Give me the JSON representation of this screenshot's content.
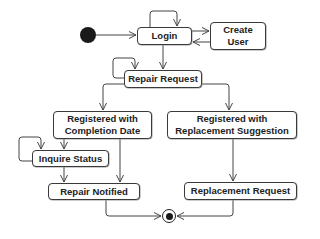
{
  "diagram": {
    "type": "UML activity diagram",
    "initial_node": {
      "id": "start"
    },
    "final_node": {
      "id": "end"
    },
    "nodes": [
      {
        "id": "login",
        "lines": [
          "Login"
        ]
      },
      {
        "id": "create_user",
        "lines": [
          "Create",
          "User"
        ]
      },
      {
        "id": "repair_request",
        "lines": [
          "Repair Request"
        ]
      },
      {
        "id": "reg_completion",
        "lines": [
          "Registered with",
          "Completion Date"
        ]
      },
      {
        "id": "reg_replacement",
        "lines": [
          "Registered with",
          "Replacement Suggestion"
        ]
      },
      {
        "id": "inquire_status",
        "lines": [
          "Inquire Status"
        ]
      },
      {
        "id": "repair_notified",
        "lines": [
          "Repair Notified"
        ]
      },
      {
        "id": "replacement_request",
        "lines": [
          "Replacement Request"
        ]
      }
    ],
    "edges": [
      {
        "from": "start",
        "to": "login"
      },
      {
        "from": "login",
        "to": "login",
        "kind": "self-loop"
      },
      {
        "from": "login",
        "to": "create_user"
      },
      {
        "from": "create_user",
        "to": "login"
      },
      {
        "from": "login",
        "to": "repair_request"
      },
      {
        "from": "repair_request",
        "to": "repair_request",
        "kind": "self-loop"
      },
      {
        "from": "repair_request",
        "to": "reg_completion"
      },
      {
        "from": "repair_request",
        "to": "reg_replacement"
      },
      {
        "from": "reg_completion",
        "to": "inquire_status"
      },
      {
        "from": "inquire_status",
        "to": "inquire_status",
        "kind": "self-loop"
      },
      {
        "from": "inquire_status",
        "to": "repair_notified"
      },
      {
        "from": "reg_completion",
        "to": "repair_notified"
      },
      {
        "from": "reg_replacement",
        "to": "replacement_request"
      },
      {
        "from": "repair_notified",
        "to": "end"
      },
      {
        "from": "replacement_request",
        "to": "end"
      }
    ]
  },
  "colors": {
    "line": "#444444",
    "border": "#3a3a3a",
    "text": "#222222",
    "fill": "#ffffff",
    "node_dark": "#1a1a1a"
  }
}
